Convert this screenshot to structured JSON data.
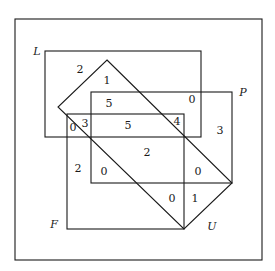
{
  "diagram": {
    "type": "venn-diagram",
    "sets": [
      {
        "id": "L",
        "label": "L",
        "shape": "rectangle"
      },
      {
        "id": "P",
        "label": "P",
        "shape": "rectangle"
      },
      {
        "id": "F",
        "label": "F",
        "shape": "rectangle"
      },
      {
        "id": "U",
        "label": "U",
        "shape": "diamond"
      }
    ],
    "regions": [
      {
        "value": "2",
        "x": 80,
        "y": 73
      },
      {
        "value": "1",
        "x": 107,
        "y": 84
      },
      {
        "value": "5",
        "x": 109,
        "y": 107
      },
      {
        "value": "0",
        "x": 192,
        "y": 103
      },
      {
        "value": "3",
        "x": 85,
        "y": 127
      },
      {
        "value": "0",
        "x": 73,
        "y": 131
      },
      {
        "value": "5",
        "x": 128,
        "y": 129
      },
      {
        "value": "4",
        "x": 177,
        "y": 125
      },
      {
        "value": "3",
        "x": 220,
        "y": 134
      },
      {
        "value": "2",
        "x": 147,
        "y": 156
      },
      {
        "value": "2",
        "x": 78,
        "y": 172
      },
      {
        "value": "0",
        "x": 104,
        "y": 175
      },
      {
        "value": "0",
        "x": 198,
        "y": 175
      },
      {
        "value": "0",
        "x": 172,
        "y": 202
      },
      {
        "value": "1",
        "x": 195,
        "y": 202
      }
    ]
  }
}
